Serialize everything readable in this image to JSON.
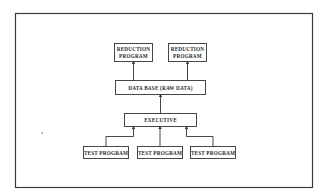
{
  "diagram": {
    "type": "block-flow",
    "nodes": {
      "reduction_left": {
        "line1": "REDUCTION",
        "line2": "PROGRAM"
      },
      "reduction_right": {
        "line1": "REDUCTION",
        "line2": "PROGRAM"
      },
      "data_base": {
        "label": "DATA BASE (RAW DATA)"
      },
      "executive": {
        "label": "EXECUTIVE"
      },
      "test_left": {
        "label": "TEST PROGRAM"
      },
      "test_center": {
        "label": "TEST PROGRAM"
      },
      "test_right": {
        "label": "TEST PROGRAM"
      }
    },
    "edges": [
      {
        "from": "TEST PROGRAM (left)",
        "to": "EXECUTIVE"
      },
      {
        "from": "TEST PROGRAM (center)",
        "to": "EXECUTIVE"
      },
      {
        "from": "TEST PROGRAM (right)",
        "to": "EXECUTIVE"
      },
      {
        "from": "EXECUTIVE",
        "to": "DATA BASE (RAW DATA)"
      },
      {
        "from": "DATA BASE (RAW DATA)",
        "to": "REDUCTION PROGRAM (left)"
      },
      {
        "from": "DATA BASE (RAW DATA)",
        "to": "REDUCTION PROGRAM (right)"
      }
    ],
    "colors": {
      "stroke": "#333333",
      "frame": "#3a3a3a",
      "background": "#ffffff"
    }
  }
}
